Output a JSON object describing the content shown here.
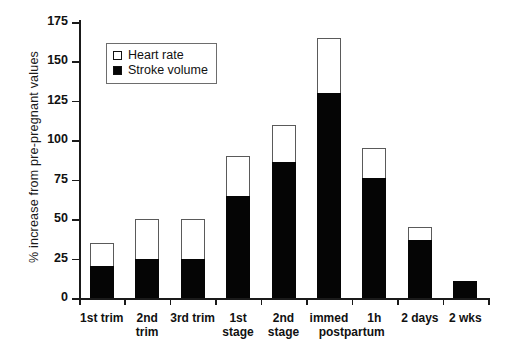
{
  "chart_data": {
    "type": "bar",
    "title": "",
    "subtitle": "",
    "xlabel": "",
    "ylabel": "% increase from pre-pregnant values",
    "ylim": [
      0,
      175
    ],
    "yticks": [
      0,
      25,
      50,
      75,
      100,
      125,
      150,
      175
    ],
    "grid": false,
    "stacked": true,
    "legend_position": "top-left",
    "categories": [
      "1st trim",
      "2nd trim",
      "3rd trim",
      "1st stage",
      "2nd stage",
      "immed",
      "1h",
      "2 days",
      "2 wks"
    ],
    "annotations": [
      "postpartum"
    ],
    "series": [
      {
        "name": "Stroke volume",
        "color": "#050505",
        "values": [
          20,
          25,
          25,
          65,
          86,
          130,
          76,
          37,
          11
        ]
      },
      {
        "name": "Heart rate",
        "color": "#ffffff",
        "values": [
          15,
          25,
          25,
          25,
          24,
          35,
          19,
          8,
          0
        ]
      }
    ],
    "totals": [
      35,
      50,
      50,
      90,
      110,
      165,
      95,
      45,
      11
    ]
  },
  "legend": {
    "items": [
      {
        "label": "Heart rate",
        "swatch": "open-square"
      },
      {
        "label": "Stroke volume",
        "swatch": "filled-square"
      }
    ]
  },
  "axis": {
    "y_title": "% increase from pre-pregnant values",
    "y_tick_labels": [
      "0",
      "25",
      "50",
      "75",
      "100",
      "125",
      "150",
      "175"
    ]
  },
  "x_labels": [
    {
      "line1": "1st trim",
      "line2": ""
    },
    {
      "line1": "2nd",
      "line2": "trim"
    },
    {
      "line1": "3rd trim",
      "line2": ""
    },
    {
      "line1": "1st",
      "line2": "stage"
    },
    {
      "line1": "2nd",
      "line2": "stage"
    },
    {
      "line1": "immed",
      "line2": ""
    },
    {
      "line1": "1h",
      "line2": ""
    },
    {
      "line1": "2 days",
      "line2": ""
    },
    {
      "line1": "2 wks",
      "line2": ""
    }
  ],
  "postpartum_label": "postpartum",
  "colors": {
    "stroke_volume": "#050505",
    "heart_rate": "#ffffff",
    "axis": "#1a1a1a",
    "bar_outline": "#5a5a5a",
    "background": "#ffffff"
  }
}
